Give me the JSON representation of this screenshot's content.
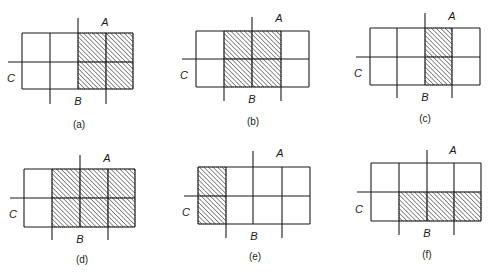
{
  "figure": {
    "variables": [
      "A",
      "B",
      "C"
    ],
    "hatch_color": "#555555",
    "line_color": "#1a1a1a",
    "maps": [
      {
        "id": "a",
        "caption": "(a)",
        "label_a": "A",
        "label_b": "B",
        "label_c": "C",
        "grid": {
          "rows": 2,
          "cols": 4
        },
        "shaded_cells": [
          [
            0,
            2
          ],
          [
            0,
            3
          ],
          [
            1,
            2
          ],
          [
            1,
            3
          ]
        ],
        "geometry": {
          "xs": [
            22,
            50,
            78,
            106,
            133
          ],
          "ys": [
            33,
            62,
            89
          ],
          "a_line_top": 18,
          "c_line_left": 8,
          "b_line_bottom": 104,
          "a_pos": [
            105,
            26
          ],
          "b_pos": [
            78,
            105
          ],
          "c_pos": [
            11,
            82
          ],
          "caption_pos": [
            79,
            128
          ]
        }
      },
      {
        "id": "b",
        "caption": "(b)",
        "label_a": "A",
        "label_b": "B",
        "label_c": "C",
        "grid": {
          "rows": 2,
          "cols": 4
        },
        "shaded_cells": [
          [
            0,
            1
          ],
          [
            0,
            2
          ],
          [
            1,
            1
          ],
          [
            1,
            2
          ]
        ],
        "geometry": {
          "xs": [
            196,
            224,
            252,
            281,
            309
          ],
          "ys": [
            31,
            59,
            87
          ],
          "a_line_top": 17,
          "c_line_left": 182,
          "b_line_bottom": 101,
          "a_pos": [
            279,
            22
          ],
          "b_pos": [
            252,
            103
          ],
          "c_pos": [
            184,
            79
          ],
          "caption_pos": [
            253,
            125
          ]
        }
      },
      {
        "id": "c",
        "caption": "(c)",
        "label_a": "A",
        "label_b": "B",
        "label_c": "C",
        "grid": {
          "rows": 2,
          "cols": 4
        },
        "shaded_cells": [
          [
            0,
            2
          ],
          [
            1,
            2
          ]
        ],
        "geometry": {
          "xs": [
            370,
            397,
            425,
            452,
            480
          ],
          "ys": [
            28,
            57,
            85
          ],
          "a_line_top": 13,
          "c_line_left": 356,
          "b_line_bottom": 98,
          "a_pos": [
            452,
            20
          ],
          "b_pos": [
            425,
            101
          ],
          "c_pos": [
            358,
            77
          ],
          "caption_pos": [
            425,
            122
          ]
        }
      },
      {
        "id": "d",
        "caption": "(d)",
        "label_a": "A",
        "label_b": "B",
        "label_c": "C",
        "grid": {
          "rows": 2,
          "cols": 4
        },
        "shaded_cells": [
          [
            0,
            1
          ],
          [
            0,
            2
          ],
          [
            0,
            3
          ],
          [
            1,
            1
          ],
          [
            1,
            2
          ],
          [
            1,
            3
          ]
        ],
        "geometry": {
          "xs": [
            24,
            52,
            80,
            108,
            135
          ],
          "ys": [
            169,
            198,
            227
          ],
          "a_line_top": 155,
          "c_line_left": 10,
          "b_line_bottom": 240,
          "a_pos": [
            107,
            162
          ],
          "b_pos": [
            80,
            243
          ],
          "c_pos": [
            13,
            218
          ],
          "caption_pos": [
            82,
            263
          ]
        }
      },
      {
        "id": "e",
        "caption": "(e)",
        "label_a": "A",
        "label_b": "B",
        "label_c": "C",
        "grid": {
          "rows": 2,
          "cols": 4
        },
        "shaded_cells": [
          [
            0,
            0
          ],
          [
            1,
            0
          ]
        ],
        "geometry": {
          "xs": [
            198,
            226,
            253,
            282,
            310
          ],
          "ys": [
            167,
            196,
            224
          ],
          "a_line_top": 151,
          "c_line_left": 184,
          "b_line_bottom": 238,
          "a_pos": [
            280,
            157
          ],
          "b_pos": [
            254,
            240
          ],
          "c_pos": [
            186,
            216
          ],
          "caption_pos": [
            255,
            260
          ]
        }
      },
      {
        "id": "f",
        "caption": "(f)",
        "label_a": "A",
        "label_b": "B",
        "label_c": "C",
        "grid": {
          "rows": 2,
          "cols": 4
        },
        "shaded_cells": [
          [
            1,
            1
          ],
          [
            1,
            2
          ],
          [
            1,
            3
          ]
        ],
        "geometry": {
          "xs": [
            371,
            399,
            427,
            454,
            481
          ],
          "ys": [
            163,
            192,
            221
          ],
          "a_line_top": 150,
          "c_line_left": 357,
          "b_line_bottom": 235,
          "a_pos": [
            453,
            154
          ],
          "b_pos": [
            427,
            237
          ],
          "c_pos": [
            359,
            213
          ],
          "caption_pos": [
            427,
            258
          ]
        }
      }
    ]
  }
}
